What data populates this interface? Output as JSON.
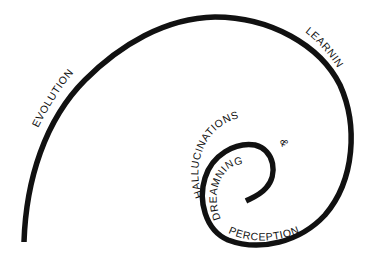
{
  "diagram": {
    "type": "spiral",
    "stroke_color": "#111111",
    "background": "#ffffff",
    "labels": {
      "evolution": "EVOLUTION",
      "learning": "LEARNING",
      "hallucinations": "HALLUCINATIONS",
      "ampersand": "&",
      "dreaming": "DREAMNING",
      "perception": "PERCEPTION"
    }
  }
}
